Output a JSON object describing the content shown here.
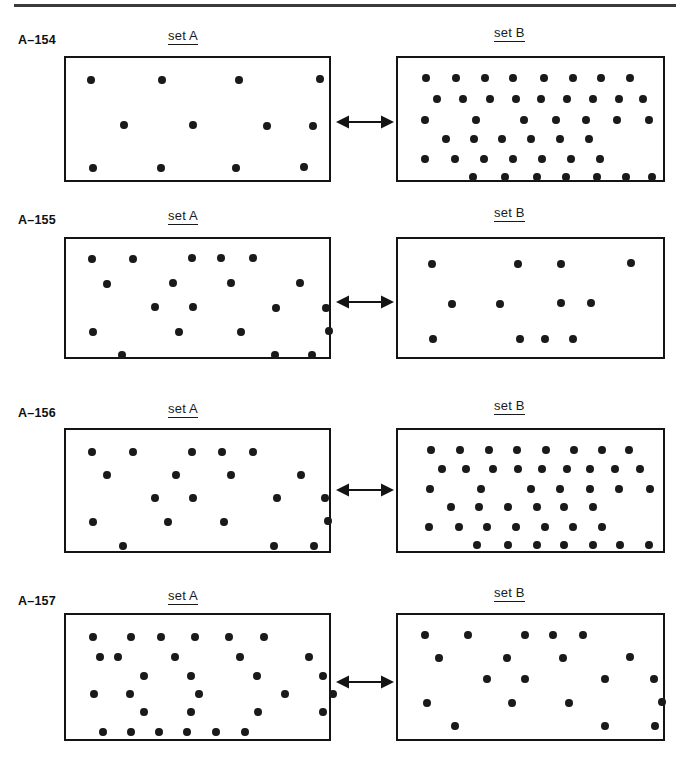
{
  "page": {
    "background": "#ffffff",
    "ink_color": "#1a1a1a",
    "width": 690,
    "height": 760,
    "top_rule": {
      "x": 14,
      "y": 4,
      "width": 662,
      "height": 3
    }
  },
  "labels": {
    "set_a": "set A",
    "set_b": "set B"
  },
  "arrow_icon": "double-headed-arrow-icon",
  "rows": [
    {
      "id": "A-154",
      "label": "A–154",
      "label_pos": {
        "x": 18,
        "y": 33
      },
      "title_a_pos": {
        "x": 168,
        "y": 28
      },
      "title_b_pos": {
        "x": 494,
        "y": 25
      },
      "arrow": {
        "x": 336,
        "y": 113,
        "width": 58
      },
      "set_a": {
        "box": {
          "x": 64,
          "y": 56,
          "width": 267,
          "height": 126
        },
        "dot_count": 12,
        "dots": [
          [
            25,
            22
          ],
          [
            96,
            22
          ],
          [
            173,
            22
          ],
          [
            254,
            21
          ],
          [
            58,
            67
          ],
          [
            127,
            67
          ],
          [
            201,
            68
          ],
          [
            247,
            68
          ],
          [
            27,
            110
          ],
          [
            95,
            110
          ],
          [
            170,
            110
          ],
          [
            238,
            109
          ]
        ]
      },
      "set_b": {
        "box": {
          "x": 396,
          "y": 56,
          "width": 269,
          "height": 126
        },
        "dot_count": 46,
        "dots": [
          [
            28,
            20
          ],
          [
            58,
            20
          ],
          [
            87,
            20
          ],
          [
            115,
            20
          ],
          [
            146,
            20
          ],
          [
            175,
            20
          ],
          [
            203,
            20
          ],
          [
            232,
            20
          ],
          [
            39,
            41
          ],
          [
            65,
            41
          ],
          [
            92,
            41
          ],
          [
            118,
            41
          ],
          [
            143,
            41
          ],
          [
            169,
            41
          ],
          [
            195,
            41
          ],
          [
            221,
            41
          ],
          [
            245,
            41
          ],
          [
            27,
            62
          ],
          [
            78,
            62
          ],
          [
            126,
            62
          ],
          [
            158,
            62
          ],
          [
            188,
            62
          ],
          [
            219,
            62
          ],
          [
            251,
            62
          ],
          [
            48,
            81
          ],
          [
            76,
            81
          ],
          [
            104,
            81
          ],
          [
            133,
            81
          ],
          [
            162,
            81
          ],
          [
            191,
            81
          ],
          [
            27,
            101
          ],
          [
            57,
            101
          ],
          [
            86,
            101
          ],
          [
            115,
            101
          ],
          [
            144,
            101
          ],
          [
            173,
            101
          ],
          [
            202,
            101
          ],
          [
            75,
            119
          ],
          [
            107,
            119
          ],
          [
            139,
            119
          ],
          [
            168,
            119
          ],
          [
            199,
            119
          ],
          [
            228,
            119
          ],
          [
            254,
            119
          ]
        ]
      }
    },
    {
      "id": "A-155",
      "label": "A–155",
      "label_pos": {
        "x": 18,
        "y": 213
      },
      "title_a_pos": {
        "x": 168,
        "y": 208
      },
      "title_b_pos": {
        "x": 494,
        "y": 205
      },
      "arrow": {
        "x": 336,
        "y": 293,
        "width": 58
      },
      "set_a": {
        "box": {
          "x": 64,
          "y": 237,
          "width": 267,
          "height": 122
        },
        "dot_count": 20,
        "dots": [
          [
            26,
            20
          ],
          [
            67,
            20
          ],
          [
            126,
            19
          ],
          [
            155,
            19
          ],
          [
            187,
            19
          ],
          [
            41,
            45
          ],
          [
            107,
            44
          ],
          [
            165,
            44
          ],
          [
            234,
            44
          ],
          [
            89,
            68
          ],
          [
            127,
            68
          ],
          [
            210,
            69
          ],
          [
            260,
            69
          ],
          [
            27,
            93
          ],
          [
            113,
            93
          ],
          [
            175,
            93
          ],
          [
            263,
            92
          ],
          [
            56,
            116
          ],
          [
            209,
            116
          ],
          [
            246,
            116
          ]
        ]
      },
      "set_b": {
        "box": {
          "x": 396,
          "y": 237,
          "width": 269,
          "height": 122
        },
        "dot_count": 12,
        "dots": [
          [
            34,
            25
          ],
          [
            120,
            25
          ],
          [
            163,
            25
          ],
          [
            233,
            24
          ],
          [
            54,
            65
          ],
          [
            102,
            65
          ],
          [
            163,
            64
          ],
          [
            193,
            64
          ],
          [
            35,
            100
          ],
          [
            122,
            100
          ],
          [
            147,
            100
          ],
          [
            175,
            100
          ]
        ]
      }
    },
    {
      "id": "A-156",
      "label": "A–156",
      "label_pos": {
        "x": 18,
        "y": 406
      },
      "title_a_pos": {
        "x": 168,
        "y": 401
      },
      "title_b_pos": {
        "x": 494,
        "y": 398
      },
      "arrow": {
        "x": 336,
        "y": 481,
        "width": 58
      },
      "set_a": {
        "box": {
          "x": 64,
          "y": 428,
          "width": 267,
          "height": 125
        },
        "dot_count": 20,
        "dots": [
          [
            26,
            22
          ],
          [
            67,
            22
          ],
          [
            126,
            22
          ],
          [
            156,
            22
          ],
          [
            187,
            22
          ],
          [
            41,
            45
          ],
          [
            110,
            45
          ],
          [
            165,
            45
          ],
          [
            235,
            45
          ],
          [
            89,
            68
          ],
          [
            127,
            68
          ],
          [
            211,
            68
          ],
          [
            259,
            68
          ],
          [
            27,
            92
          ],
          [
            102,
            92
          ],
          [
            158,
            92
          ],
          [
            262,
            91
          ],
          [
            57,
            116
          ],
          [
            208,
            116
          ],
          [
            248,
            116
          ]
        ]
      },
      "set_b": {
        "box": {
          "x": 396,
          "y": 428,
          "width": 269,
          "height": 125
        },
        "dot_count": 46,
        "dots": [
          [
            33,
            20
          ],
          [
            62,
            20
          ],
          [
            91,
            20
          ],
          [
            119,
            20
          ],
          [
            148,
            20
          ],
          [
            176,
            20
          ],
          [
            204,
            20
          ],
          [
            231,
            20
          ],
          [
            44,
            39
          ],
          [
            68,
            39
          ],
          [
            95,
            39
          ],
          [
            120,
            39
          ],
          [
            144,
            39
          ],
          [
            169,
            39
          ],
          [
            192,
            39
          ],
          [
            217,
            39
          ],
          [
            242,
            39
          ],
          [
            32,
            59
          ],
          [
            83,
            59
          ],
          [
            133,
            59
          ],
          [
            162,
            59
          ],
          [
            192,
            59
          ],
          [
            221,
            59
          ],
          [
            252,
            59
          ],
          [
            53,
            77
          ],
          [
            81,
            77
          ],
          [
            110,
            77
          ],
          [
            139,
            77
          ],
          [
            166,
            77
          ],
          [
            195,
            77
          ],
          [
            31,
            97
          ],
          [
            61,
            97
          ],
          [
            89,
            97
          ],
          [
            118,
            97
          ],
          [
            147,
            97
          ],
          [
            175,
            97
          ],
          [
            204,
            97
          ],
          [
            79,
            115
          ],
          [
            110,
            115
          ],
          [
            139,
            115
          ],
          [
            166,
            115
          ],
          [
            195,
            115
          ],
          [
            222,
            115
          ],
          [
            251,
            115
          ]
        ]
      }
    },
    {
      "id": "A-157",
      "label": "A–157",
      "label_pos": {
        "x": 18,
        "y": 594
      },
      "title_a_pos": {
        "x": 168,
        "y": 588
      },
      "title_b_pos": {
        "x": 494,
        "y": 585
      },
      "arrow": {
        "x": 336,
        "y": 673,
        "width": 58
      },
      "set_a": {
        "box": {
          "x": 64,
          "y": 613,
          "width": 267,
          "height": 128
        },
        "dot_count": 33,
        "dots": [
          [
            27,
            22
          ],
          [
            65,
            22
          ],
          [
            95,
            22
          ],
          [
            129,
            22
          ],
          [
            163,
            22
          ],
          [
            198,
            22
          ],
          [
            34,
            42
          ],
          [
            52,
            42
          ],
          [
            109,
            42
          ],
          [
            174,
            42
          ],
          [
            243,
            42
          ],
          [
            78,
            61
          ],
          [
            125,
            61
          ],
          [
            191,
            61
          ],
          [
            257,
            61
          ],
          [
            28,
            79
          ],
          [
            64,
            79
          ],
          [
            133,
            79
          ],
          [
            219,
            79
          ],
          [
            267,
            79
          ],
          [
            78,
            97
          ],
          [
            125,
            97
          ],
          [
            192,
            97
          ],
          [
            257,
            97
          ],
          [
            37,
            117
          ],
          [
            65,
            117
          ],
          [
            93,
            117
          ],
          [
            121,
            117
          ],
          [
            150,
            117
          ],
          [
            179,
            117
          ]
        ]
      },
      "set_b": {
        "box": {
          "x": 396,
          "y": 613,
          "width": 269,
          "height": 128
        },
        "dot_count": 20,
        "dots": [
          [
            27,
            20
          ],
          [
            70,
            20
          ],
          [
            127,
            20
          ],
          [
            155,
            20
          ],
          [
            185,
            20
          ],
          [
            41,
            43
          ],
          [
            109,
            43
          ],
          [
            165,
            43
          ],
          [
            232,
            42
          ],
          [
            89,
            64
          ],
          [
            127,
            64
          ],
          [
            207,
            64
          ],
          [
            256,
            64
          ],
          [
            29,
            88
          ],
          [
            114,
            88
          ],
          [
            171,
            88
          ],
          [
            264,
            87
          ],
          [
            57,
            111
          ],
          [
            207,
            111
          ],
          [
            257,
            111
          ]
        ]
      }
    }
  ]
}
